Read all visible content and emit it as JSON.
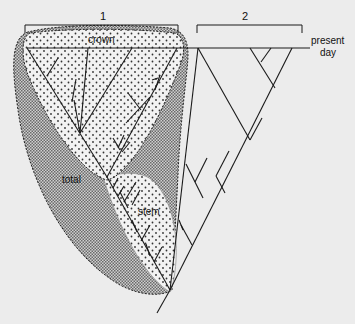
{
  "figure": {
    "type": "phylogenetic-tree-diagram",
    "background_color": "#ececec",
    "line_color": "#1a1a1a",
    "brackets": [
      {
        "id": "1",
        "label": "1"
      },
      {
        "id": "2",
        "label": "2"
      }
    ],
    "timeline": {
      "label_line1": "present",
      "label_line2": "day"
    },
    "groups": {
      "crown": {
        "label": "crown",
        "pattern": "sparse-dots",
        "fill": "#f4f4f4"
      },
      "stem": {
        "label": "stem",
        "pattern": "sparse-dots",
        "fill": "#f4f4f4"
      },
      "total": {
        "label": "total",
        "pattern": "dense-stipple",
        "fill": "#9a9a9a"
      }
    }
  }
}
